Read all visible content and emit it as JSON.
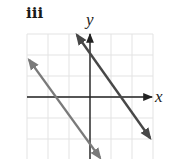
{
  "panel": {
    "label": "iii"
  },
  "chart_data": {
    "type": "line",
    "title": "iii",
    "xlabel": "x",
    "ylabel": "y",
    "xlim": [
      -3,
      3
    ],
    "ylim": [
      -3,
      3
    ],
    "grid": true,
    "grid_step": 1,
    "ticks_labeled": false,
    "legend": null,
    "series": [
      {
        "name": "left line",
        "color": "#7a7a7a",
        "equation_estimate": "y = -1.35x - 2.2",
        "x_intercept": -1.67,
        "y_intercept": -2.2,
        "arrows_both_ends": true,
        "points": [
          [
            -2.9,
            1.77
          ],
          [
            0.48,
            -2.9
          ]
        ]
      },
      {
        "name": "right line",
        "color": "#474747",
        "equation_estimate": "y = -1.5x + 2.3",
        "x_intercept": 1.5,
        "y_intercept": 2.3,
        "arrows_both_ends": true,
        "points": [
          [
            -0.62,
            2.95
          ],
          [
            2.86,
            -1.95
          ]
        ]
      }
    ]
  },
  "style": {
    "grid_color": "#e3e3e3",
    "axis_color": "#222222"
  }
}
